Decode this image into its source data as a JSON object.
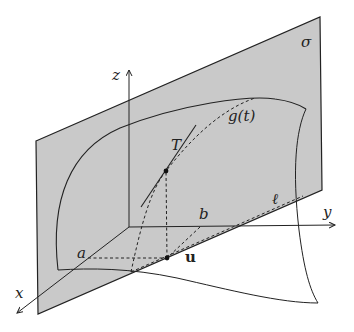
{
  "diagram": {
    "type": "3d-geometry",
    "colors": {
      "plane_fill": "#c9c9c9",
      "stroke": "#222222",
      "background": "#ffffff"
    },
    "labels": {
      "plane": "σ",
      "curve": "g(t)",
      "tangent": "T",
      "line": "ℓ",
      "point_a": "a",
      "point_b": "b",
      "vector_u": "u",
      "axis_x": "x",
      "axis_y": "y",
      "axis_z": "z"
    }
  }
}
